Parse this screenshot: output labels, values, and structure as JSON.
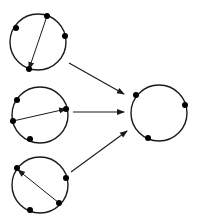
{
  "diagram": {
    "width": 197,
    "height": 223,
    "colors": {
      "stroke": "#1a1a1a",
      "dot": "#000000",
      "background": "#ffffff"
    },
    "source_circles": [
      {
        "id": "circle-top",
        "cx": 38,
        "cy": 42,
        "r": 28,
        "points": [
          [
            47,
            16
          ],
          [
            16,
            28
          ],
          [
            65,
            36
          ],
          [
            29,
            69
          ]
        ],
        "chord": {
          "from": [
            47,
            16
          ],
          "to": [
            29,
            69
          ]
        }
      },
      {
        "id": "circle-middle",
        "cx": 40,
        "cy": 115,
        "r": 28,
        "points": [
          [
            17,
            100
          ],
          [
            13,
            121
          ],
          [
            66,
            109
          ],
          [
            30,
            139
          ]
        ],
        "chord": {
          "from": [
            13,
            121
          ],
          "to": [
            66,
            109
          ]
        }
      },
      {
        "id": "circle-bottom",
        "cx": 40,
        "cy": 185,
        "r": 28,
        "points": [
          [
            17,
            168
          ],
          [
            66,
            178
          ],
          [
            59,
            203
          ],
          [
            30,
            210
          ]
        ],
        "chord": {
          "from": [
            59,
            203
          ],
          "to": [
            18,
            170
          ]
        }
      }
    ],
    "result_circle": {
      "id": "circle-result",
      "cx": 159,
      "cy": 113,
      "r": 28,
      "points": [
        [
          136,
          95
        ],
        [
          185,
          105
        ],
        [
          148,
          138
        ]
      ]
    },
    "arrows": [
      {
        "from": [
          69,
          63
        ],
        "to": [
          124,
          94
        ]
      },
      {
        "from": [
          73,
          112
        ],
        "to": [
          124,
          112
        ]
      },
      {
        "from": [
          71,
          172
        ],
        "to": [
          127,
          131
        ]
      }
    ]
  }
}
